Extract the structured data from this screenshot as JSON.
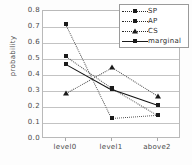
{
  "chart_data": {
    "type": "line",
    "title": "",
    "xlabel": "",
    "ylabel": "probability",
    "categories": [
      "level0",
      "level1",
      "above2"
    ],
    "ylim": [
      0.0,
      0.8
    ],
    "yticks": [
      "0.0",
      "0.1",
      "0.2",
      "0.3",
      "0.4",
      "0.5",
      "0.6",
      "0.7",
      "0.8"
    ],
    "ytick_values": [
      0.0,
      0.1,
      0.2,
      0.3,
      0.4,
      0.5,
      0.6,
      0.7,
      0.8
    ],
    "grid": true,
    "legend_position": "top-right",
    "series": [
      {
        "name": "SP",
        "values": [
          0.72,
          0.13,
          0.15
        ],
        "marker": "square",
        "linestyle": "dotted",
        "color": "#1a1a1a"
      },
      {
        "name": "AP",
        "values": [
          0.52,
          0.32,
          0.15
        ],
        "marker": "square",
        "linestyle": "dotted",
        "color": "#1a1a1a"
      },
      {
        "name": "CS",
        "values": [
          0.29,
          0.45,
          0.27
        ],
        "marker": "triangle",
        "linestyle": "dotted",
        "color": "#1a1a1a"
      },
      {
        "name": "marginal",
        "values": [
          0.47,
          0.31,
          0.21
        ],
        "marker": "square",
        "linestyle": "solid",
        "color": "#111111"
      }
    ]
  },
  "axis": {
    "y_title": "probability"
  },
  "colors": {
    "gridline": "#c3c3c3",
    "frame": "#b9b9b9",
    "text": "#4a4a4a",
    "data": "#1a1a1a"
  }
}
